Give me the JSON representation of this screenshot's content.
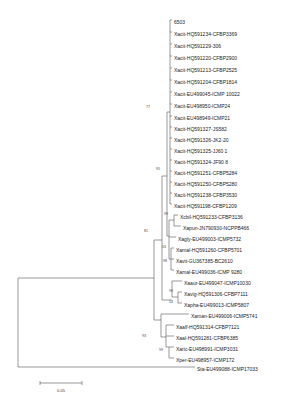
{
  "figure": {
    "type": "phylogenetic-tree",
    "scale_bar": {
      "label": "0.05",
      "x1": 40,
      "x2": 82,
      "y": 383
    }
  },
  "leaves": [
    {
      "label": "6503",
      "x": 174,
      "y": 22
    },
    {
      "label": "Xacit-HQ591234-CFBP3369",
      "x": 174,
      "y": 34
    },
    {
      "label": "Xacit-HQ591229-306",
      "x": 174,
      "y": 46
    },
    {
      "label": "Xacit-HQ591220-CFBP2900",
      "x": 174,
      "y": 58
    },
    {
      "label": "Xacit-HQ591213-CFBP2525",
      "x": 174,
      "y": 70
    },
    {
      "label": "Xacit-HQ591204-CFBP1814",
      "x": 174,
      "y": 82
    },
    {
      "label": "Xacit-EU499045-ICMP 10022",
      "x": 174,
      "y": 94
    },
    {
      "label": "Xacit-EU498950-ICMP24",
      "x": 174,
      "y": 106
    },
    {
      "label": "Xacit-EU498949-ICMP21",
      "x": 174,
      "y": 118
    },
    {
      "label": "Xacit-HQ591327-JS582",
      "x": 174,
      "y": 129
    },
    {
      "label": "Xacit-HQ591326-JK2-20",
      "x": 174,
      "y": 140
    },
    {
      "label": "Xacit-HQ591325-JJ60 1",
      "x": 174,
      "y": 151
    },
    {
      "label": "Xacit-HQ591324-JF90 8",
      "x": 174,
      "y": 162
    },
    {
      "label": "Xacit-HQ591251-CFBP5284",
      "x": 174,
      "y": 173
    },
    {
      "label": "Xacit-HQ591250-CFBP5280",
      "x": 174,
      "y": 184
    },
    {
      "label": "Xacit-HQ591238-CFBP3530",
      "x": 174,
      "y": 195
    },
    {
      "label": "Xacit-HQ591198-CFBP1209",
      "x": 174,
      "y": 206
    },
    {
      "label": "Xcbil-HQ591233-CFBP3136",
      "x": 180,
      "y": 217
    },
    {
      "label": "Xapun-JN790930-NCPPB466",
      "x": 183,
      "y": 228
    },
    {
      "label": "Xagly-EU499003-ICMP5732",
      "x": 178,
      "y": 239
    },
    {
      "label": "Xamal-HQ591260-CFBP5701",
      "x": 176,
      "y": 250
    },
    {
      "label": "Xavit-GU367385-BC2610",
      "x": 176,
      "y": 261
    },
    {
      "label": "Xamal-EU499036-ICMP 9280",
      "x": 176,
      "y": 272
    },
    {
      "label": "Xaaur-EU499047-ICMP10030",
      "x": 184,
      "y": 283
    },
    {
      "label": "Xavig-HQ591306-CFBP7111",
      "x": 184,
      "y": 294
    },
    {
      "label": "Xapha-EU499013-ICMP5807",
      "x": 184,
      "y": 305
    },
    {
      "label": "Xaman-EU499006-ICMP5741",
      "x": 191,
      "y": 316
    },
    {
      "label": "Xaalf-HQ591314-CFBP7121",
      "x": 176,
      "y": 327
    },
    {
      "label": "Xaal-HQ591281-CFBP6385",
      "x": 176,
      "y": 338
    },
    {
      "label": "Xaric-EU498991-ICMP3031",
      "x": 176,
      "y": 349
    },
    {
      "label": "Xper-EU498957-ICMP172",
      "x": 176,
      "y": 360
    },
    {
      "label": "Sta-EU499088-ICMP17033",
      "x": 197,
      "y": 369
    }
  ],
  "bootstrap": [
    {
      "value": "77",
      "x": 150,
      "y": 108
    },
    {
      "value": "95",
      "x": 160,
      "y": 170
    },
    {
      "value": "99",
      "x": 168,
      "y": 215
    },
    {
      "value": "81",
      "x": 148,
      "y": 232
    },
    {
      "value": "53",
      "x": 166,
      "y": 248
    },
    {
      "value": "98",
      "x": 167,
      "y": 262
    },
    {
      "value": "99",
      "x": 173,
      "y": 292
    },
    {
      "value": "14",
      "x": 173,
      "y": 303
    },
    {
      "value": "93",
      "x": 146,
      "y": 337
    },
    {
      "value": "99",
      "x": 163,
      "y": 351
    }
  ],
  "branches": [
    [
      18,
      278,
      18,
      367
    ],
    [
      18,
      278,
      154,
      278
    ],
    [
      18,
      367,
      195,
      367
    ],
    [
      154,
      240,
      154,
      320
    ],
    [
      154,
      240,
      162,
      240
    ],
    [
      154,
      320,
      161,
      320
    ],
    [
      162,
      176,
      162,
      300
    ],
    [
      162,
      176,
      167,
      176
    ],
    [
      162,
      300,
      172,
      300
    ],
    [
      167,
      112,
      167,
      236
    ],
    [
      167,
      112,
      170,
      112
    ],
    [
      167,
      236,
      169,
      236
    ],
    [
      170,
      20,
      170,
      204
    ],
    [
      170,
      20,
      172,
      20
    ],
    [
      170,
      32,
      172,
      32
    ],
    [
      170,
      44,
      172,
      44
    ],
    [
      170,
      56,
      172,
      56
    ],
    [
      170,
      68,
      172,
      68
    ],
    [
      170,
      80,
      172,
      80
    ],
    [
      170,
      92,
      172,
      92
    ],
    [
      170,
      104,
      172,
      104
    ],
    [
      170,
      116,
      172,
      116
    ],
    [
      170,
      127,
      172,
      127
    ],
    [
      170,
      138,
      172,
      138
    ],
    [
      170,
      149,
      172,
      149
    ],
    [
      170,
      160,
      172,
      160
    ],
    [
      170,
      171,
      172,
      171
    ],
    [
      170,
      182,
      172,
      182
    ],
    [
      170,
      193,
      172,
      193
    ],
    [
      170,
      204,
      172,
      204
    ],
    [
      169,
      220,
      169,
      259
    ],
    [
      169,
      220,
      174,
      220
    ],
    [
      169,
      237,
      176,
      237
    ],
    [
      169,
      259,
      171,
      259
    ],
    [
      174,
      215,
      174,
      226
    ],
    [
      174,
      215,
      178,
      215
    ],
    [
      174,
      226,
      181,
      226
    ],
    [
      171,
      248,
      171,
      270
    ],
    [
      171,
      248,
      174,
      248
    ],
    [
      171,
      259,
      174,
      259
    ],
    [
      171,
      270,
      174,
      270
    ],
    [
      172,
      281,
      172,
      297
    ],
    [
      172,
      281,
      182,
      281
    ],
    [
      172,
      297,
      178,
      297
    ],
    [
      178,
      292,
      178,
      303
    ],
    [
      178,
      292,
      182,
      292
    ],
    [
      178,
      303,
      182,
      303
    ],
    [
      161,
      314,
      161,
      337
    ],
    [
      161,
      314,
      189,
      314
    ],
    [
      161,
      337,
      166,
      337
    ],
    [
      166,
      325,
      166,
      347
    ],
    [
      166,
      325,
      174,
      325
    ],
    [
      166,
      336,
      174,
      336
    ],
    [
      166,
      347,
      169,
      347
    ],
    [
      169,
      347,
      169,
      358
    ],
    [
      169,
      347,
      174,
      347
    ],
    [
      169,
      358,
      174,
      358
    ]
  ]
}
